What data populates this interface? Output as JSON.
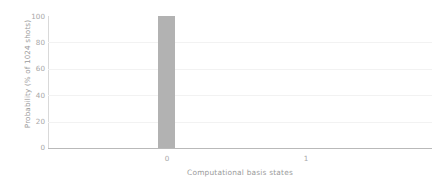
{
  "chart_data": {
    "type": "bar",
    "title": "",
    "subtitle": "",
    "xlabel": "Computational basis states",
    "ylabel": "Probability (% of 1024 shots)",
    "categories": [
      "0",
      "1"
    ],
    "values": [
      100,
      0
    ],
    "series": [
      {
        "name": "Probability",
        "values": [
          100,
          0
        ]
      }
    ],
    "ylim": [
      0,
      100
    ],
    "yticks": [
      0,
      20,
      40,
      60,
      80,
      100
    ],
    "ytick_labels": [
      "0",
      "20",
      "40",
      "60",
      "80",
      "100"
    ],
    "xtick_labels": [
      "0",
      "1"
    ],
    "grid": "horizontal",
    "legend": "none",
    "annotations": [],
    "colors": {
      "bar": "#b2b2b2",
      "gridline": "#f2f2f2",
      "axis": "#b9b9b9",
      "axis_left": "#d9d9d9",
      "tick_text": "#a8a8a8",
      "label_text": "#9a9a9a",
      "background": "#ffffff"
    }
  }
}
